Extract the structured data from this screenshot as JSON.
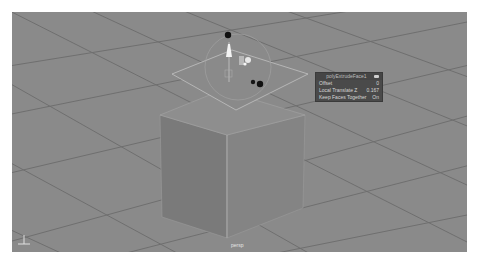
{
  "viewport": {
    "camera_label": "persp",
    "background": "#8a8a8a"
  },
  "hud_panel": {
    "title": "polyExtrudeFace1",
    "pin_icon": "pin-icon",
    "rows": [
      {
        "label": "Offset",
        "value": "0"
      },
      {
        "label": "Local Translate Z",
        "value": "0.167"
      },
      {
        "label": "Keep Faces Together",
        "value": "On"
      }
    ]
  },
  "axis_indicator": {
    "labels": [
      "Y",
      "X",
      "Z"
    ]
  },
  "colors": {
    "grid_line": "#6e6e6e",
    "cube_left": "#7c7c7c",
    "cube_right": "#848484",
    "cube_top": "#8f8f8f",
    "selected_edge": "#c9c9c9",
    "manip_dark": "#111111",
    "manip_light": "#f2f2f2"
  }
}
